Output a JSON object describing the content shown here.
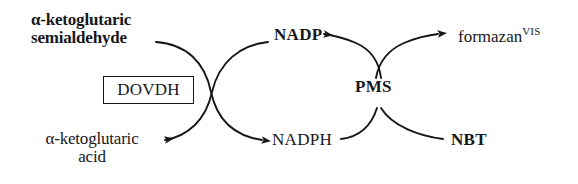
{
  "diagram": {
    "background_color": "#ffffff",
    "ink_color": "#17171a",
    "nodes": {
      "substrate_line1": "α-ketoglutaric",
      "substrate_line2": "semialdehyde",
      "enzyme": "DOVDH",
      "product_line1": "α-ketoglutaric",
      "product_line2": "acid",
      "cofactor_oxidized": "NADP",
      "cofactor_reduced": "NADPH",
      "mediator": "PMS",
      "tetrazolium": "NBT",
      "dye": "formazan",
      "dye_superscript": "VIS"
    },
    "edges": [
      {
        "name": "substrate-to-nadp-arc",
        "from": "α-ketoglutaric semialdehyde",
        "to": "NADP",
        "arrowhead": "NADP",
        "direction": "left-to-right-then-up"
      },
      {
        "name": "nadph-to-product-arc",
        "from": "NADPH",
        "to": "α-ketoglutaric acid",
        "arrowhead": "α-ketoglutaric acid",
        "direction": "right-to-left"
      },
      {
        "name": "nadph-from-substrate-arc",
        "from": "α-ketoglutaric semialdehyde",
        "to": "NADPH",
        "arrowhead": "NADPH",
        "direction": "down-and-right"
      },
      {
        "name": "nadp-from-pms-arc",
        "from": "PMS",
        "to": "NADP",
        "arrowhead": "NADP",
        "direction": "right-to-left"
      },
      {
        "name": "pms-to-formazan-arc",
        "from": "PMS",
        "to": "formazan",
        "arrowhead": "formazan",
        "direction": "up-and-right"
      },
      {
        "name": "nbt-to-pms-arc",
        "from": "NBT",
        "to": "PMS",
        "arrowhead": "none",
        "direction": "right-to-left-then-up"
      },
      {
        "name": "nadph-to-pms-arc",
        "from": "NADPH",
        "to": "PMS",
        "arrowhead": "none",
        "direction": "left-to-right-then-up"
      }
    ]
  }
}
